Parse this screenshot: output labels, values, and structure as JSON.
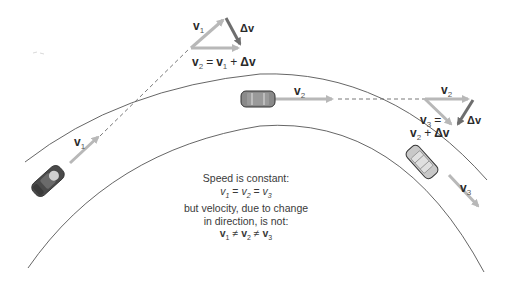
{
  "figure": {
    "colors": {
      "road_line": "#555555",
      "velocity_arrow": "#b8b8b8",
      "delta_arrow": "#6e6e6e",
      "dashed_line": "#555555",
      "car_dark": "#4a4a4a",
      "car_mid": "#8a8a8a",
      "car_light": "#c8c8c8",
      "text": "#2a2a2a"
    },
    "cars": [
      {
        "id": "car-1",
        "position": "left, lower curve",
        "velocity_label": "v",
        "velocity_sub": "1"
      },
      {
        "id": "car-2",
        "position": "top center",
        "velocity_label": "v",
        "velocity_sub": "2"
      },
      {
        "id": "car-3",
        "position": "right, lower curve",
        "velocity_label": "v",
        "velocity_sub": "3"
      }
    ],
    "triangle_top": {
      "v_label": "v",
      "v_sub": "1",
      "delta": "Δv",
      "equation": {
        "lhs": "v",
        "lhs_sub": "2",
        "eq": "=",
        "rhs1": "v",
        "rhs1_sub": "1",
        "plus": "+",
        "rhs2": "Δv"
      }
    },
    "triangle_right": {
      "v_label": "v",
      "v_sub": "2",
      "delta": "Δv",
      "equation_line1": {
        "lhs": "v",
        "lhs_sub": "3",
        "eq": "="
      },
      "equation_line2": {
        "rhs1": "v",
        "rhs1_sub": "2",
        "plus": "+",
        "rhs2": "Δv"
      }
    },
    "caption": {
      "line1": "Speed is constant:",
      "line2": {
        "a": "v",
        "a_sub": "1",
        "eq1": "=",
        "b": "v",
        "b_sub": "2",
        "eq2": "=",
        "c": "v",
        "c_sub": "3"
      },
      "line3": "but velocity, due to change",
      "line4": "in direction, is not:",
      "line5": {
        "a": "v",
        "a_sub": "1",
        "ne1": "≠",
        "b": "v",
        "b_sub": "2",
        "ne2": "≠",
        "c": "v",
        "c_sub": "3"
      }
    }
  }
}
